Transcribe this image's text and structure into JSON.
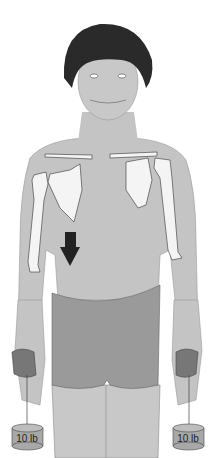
{
  "figure": {
    "arrow_direction": "down",
    "weights": [
      {
        "side": "left",
        "label": "10 lb"
      },
      {
        "side": "right",
        "label": "10 lb"
      }
    ],
    "colors": {
      "skin": "#c4c4c4",
      "hair": "#2a2a2a",
      "shorts": "#9a9a9a",
      "bone": "#f4f4f4",
      "arrow": "#222222",
      "weight": "#a8a8a8"
    }
  }
}
